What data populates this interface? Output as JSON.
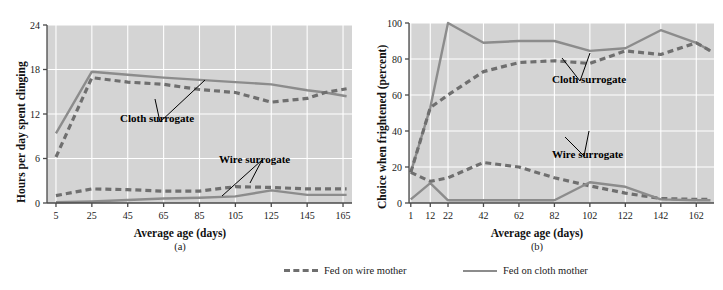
{
  "figure": {
    "style": {
      "plot_bg": "#d4d4d4",
      "grid_color": "#ffffff",
      "axis_color": "#4a4a4a",
      "cloth_line_color": "#8c8c8c",
      "wire_line_color": "#6f6f6f",
      "text_color": "#1a1a1a"
    }
  },
  "legend": {
    "items": [
      {
        "label": "Fed on wire mother",
        "style": "dashed",
        "color": "#6f6f6f",
        "name": "legend-wire-mother"
      },
      {
        "label": "Fed on cloth mother",
        "style": "solid",
        "color": "#8c8c8c",
        "name": "legend-cloth-mother"
      }
    ]
  },
  "panels": [
    {
      "id": "a",
      "caption": "(a)",
      "annotations": [
        "Cloth surrogate",
        "Wire surrogate"
      ],
      "chart_data": {
        "type": "line",
        "title": "",
        "xlabel": "Average age (days)",
        "ylabel": "Hours per day spent clinging",
        "xlim": [
          0,
          170
        ],
        "ylim": [
          0,
          24
        ],
        "xticks": [
          5,
          25,
          45,
          65,
          85,
          105,
          125,
          145,
          165
        ],
        "yticks": [
          0,
          6,
          12,
          18,
          24
        ],
        "grid": true,
        "legend_position": "below-figure",
        "series": [
          {
            "name": "Cloth surrogate — fed on cloth mother",
            "style": "solid",
            "color": "#8c8c8c",
            "x": [
              5,
              25,
              45,
              65,
              85,
              105,
              125,
              145,
              155,
              167
            ],
            "y": [
              9.4,
              17.7,
              17.3,
              16.9,
              16.6,
              16.3,
              16.0,
              15.2,
              14.9,
              14.4
            ]
          },
          {
            "name": "Cloth surrogate — fed on wire mother",
            "style": "dashed",
            "color": "#6f6f6f",
            "x": [
              5,
              25,
              45,
              65,
              85,
              105,
              125,
              145,
              155,
              167
            ],
            "y": [
              6.2,
              16.9,
              16.3,
              16.0,
              15.3,
              14.9,
              13.6,
              14.1,
              14.9,
              15.4
            ]
          },
          {
            "name": "Wire surrogate — fed on wire mother",
            "style": "dashed",
            "color": "#6f6f6f",
            "x": [
              5,
              25,
              45,
              65,
              85,
              105,
              125,
              145,
              167
            ],
            "y": [
              1.0,
              1.9,
              1.8,
              1.6,
              1.6,
              2.2,
              2.1,
              1.9,
              1.9
            ]
          },
          {
            "name": "Wire surrogate — fed on cloth mother",
            "style": "solid",
            "color": "#8c8c8c",
            "x": [
              5,
              25,
              45,
              65,
              85,
              105,
              125,
              145,
              167
            ],
            "y": [
              0.1,
              0.2,
              0.4,
              0.6,
              0.7,
              0.9,
              1.7,
              1.1,
              1.1
            ]
          }
        ]
      }
    },
    {
      "id": "b",
      "caption": "(b)",
      "annotations": [
        "Cloth surrogate",
        "Wire surrogate"
      ],
      "chart_data": {
        "type": "line",
        "title": "",
        "xlabel": "Average age (days)",
        "ylabel": "Choice when frightened (percent)",
        "xlim": [
          0,
          172
        ],
        "ylim": [
          0,
          100
        ],
        "xticks": [
          1,
          12,
          22,
          42,
          62,
          82,
          102,
          122,
          142,
          162
        ],
        "yticks": [
          0,
          20,
          40,
          60,
          80,
          100
        ],
        "grid": true,
        "legend_position": "below-figure",
        "series": [
          {
            "name": "Cloth surrogate — fed on cloth mother",
            "style": "solid",
            "color": "#8c8c8c",
            "x": [
              1,
              12,
              22,
              42,
              62,
              82,
              102,
              122,
              142,
              162,
              170
            ],
            "y": [
              17,
              53,
              100,
              89,
              90,
              90,
              84.5,
              86,
              96,
              89,
              84.5
            ]
          },
          {
            "name": "Cloth surrogate — fed on wire mother",
            "style": "dashed",
            "color": "#6f6f6f",
            "x": [
              1,
              12,
              22,
              42,
              62,
              82,
              102,
              122,
              142,
              162,
              170
            ],
            "y": [
              17,
              53,
              60,
              73,
              78,
              79,
              77.5,
              84.5,
              82.5,
              89,
              84.5
            ]
          },
          {
            "name": "Wire surrogate — fed on wire mother",
            "style": "dashed",
            "color": "#6f6f6f",
            "x": [
              1,
              12,
              22,
              42,
              62,
              82,
              102,
              122,
              142,
              162,
              170
            ],
            "y": [
              17,
              12,
              14,
              22.5,
              20,
              14,
              9.5,
              5.5,
              2.5,
              2,
              2
            ]
          },
          {
            "name": "Wire surrogate — fed on cloth mother",
            "style": "solid",
            "color": "#8c8c8c",
            "x": [
              1,
              12,
              22,
              42,
              62,
              82,
              102,
              122,
              142,
              162,
              170
            ],
            "y": [
              2,
              11,
              1.5,
              1.5,
              1.5,
              1.5,
              11.5,
              9,
              2,
              1.5,
              1.5
            ]
          }
        ]
      }
    }
  ]
}
